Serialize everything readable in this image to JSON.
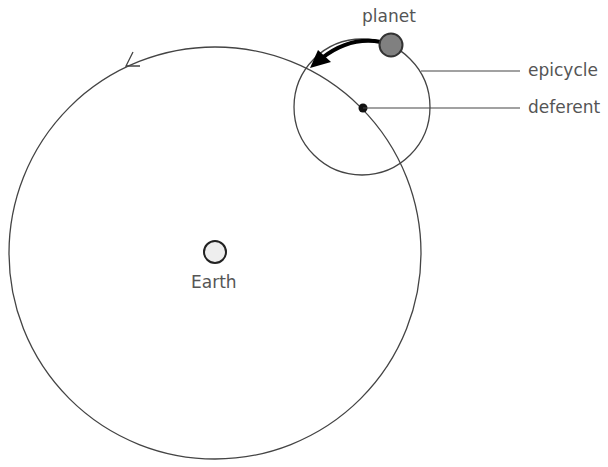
{
  "diagram": {
    "labels": {
      "planet": "planet",
      "epicycle": "epicycle",
      "deferent": "deferent",
      "earth": "Earth"
    },
    "colors": {
      "line": "#444444",
      "planet_fill": "#808080",
      "earth_fill": "#eeeeee",
      "text": "#555555"
    }
  }
}
